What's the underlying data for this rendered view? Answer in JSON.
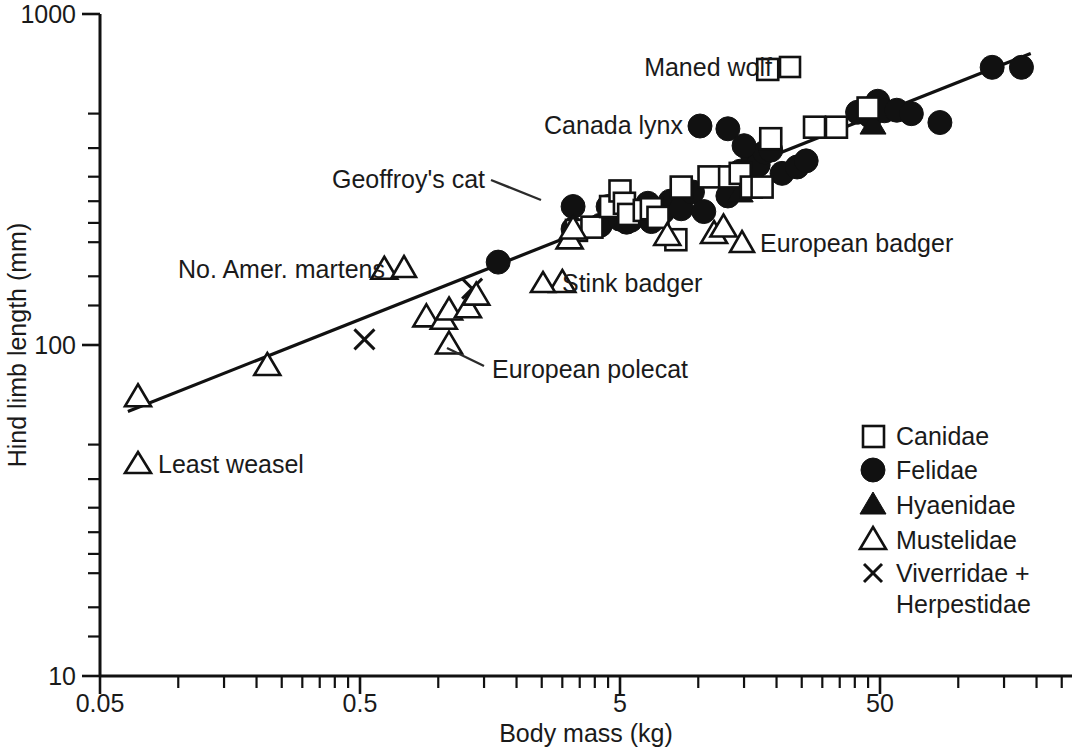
{
  "chart_data": {
    "type": "scatter",
    "title": "",
    "xlabel": "Body mass (kg)",
    "ylabel": "Hind limb length (mm)",
    "xscale": "log",
    "yscale": "log",
    "xlim": [
      0.05,
      200
    ],
    "ylim": [
      10,
      1000
    ],
    "xticklabels": [
      "0.05",
      "0.5",
      "5",
      "50"
    ],
    "xtickvalues": [
      0.05,
      0.5,
      5,
      50
    ],
    "yticklabels": [
      "1000",
      "100",
      "10"
    ],
    "ytickvalues": [
      1000,
      100,
      10
    ],
    "grid": false,
    "legend_position": "lower-right",
    "legend": [
      {
        "label": "Canidae",
        "marker": "open-square"
      },
      {
        "label": "Felidae",
        "marker": "filled-circle"
      },
      {
        "label": "Hyaenidae",
        "marker": "filled-triangle"
      },
      {
        "label": "Mustelidae",
        "marker": "open-triangle"
      },
      {
        "label": "Viverridae +",
        "marker": "cross-x"
      },
      {
        "label": "Herpestidae",
        "marker": "none"
      }
    ],
    "fit_line": {
      "description": "allometric regression line",
      "x_start": 0.064,
      "y_start": 63,
      "x_end": 190,
      "y_end": 760
    },
    "annotations": [
      {
        "text": "Maned wolf",
        "marker": "open-square"
      },
      {
        "text": "Canada lynx",
        "marker": "filled-circle"
      },
      {
        "text": "Geoffroy's cat",
        "marker": "leader-line"
      },
      {
        "text": "No. Amer. martens",
        "marker": "open-triangle"
      },
      {
        "text": "Stink badger",
        "marker": "open-triangle"
      },
      {
        "text": "European badger",
        "marker": "open-triangle"
      },
      {
        "text": "European polecat",
        "marker": "leader-line"
      },
      {
        "text": "Least weasel",
        "marker": "open-triangle"
      }
    ],
    "series": [
      {
        "name": "Canidae",
        "marker": "open-square",
        "points": [
          [
            3.4,
            222
          ],
          [
            3.9,
            227
          ],
          [
            4.6,
            262
          ],
          [
            5.0,
            292
          ],
          [
            5.2,
            268
          ],
          [
            5.4,
            248
          ],
          [
            6.2,
            255
          ],
          [
            6.6,
            258
          ],
          [
            7.0,
            243
          ],
          [
            8.2,
            208
          ],
          [
            8.6,
            300
          ],
          [
            11.0,
            322
          ],
          [
            13.2,
            322
          ],
          [
            14.5,
            330
          ],
          [
            16.0,
            300
          ],
          [
            17.6,
            300
          ],
          [
            19.0,
            420
          ],
          [
            28.0,
            455
          ],
          [
            34.0,
            455
          ],
          [
            45.0,
            520
          ],
          [
            18.5,
            680
          ]
        ]
      },
      {
        "name": "Felidae",
        "marker": "filled-circle",
        "points": [
          [
            1.7,
            178
          ],
          [
            3.3,
            262
          ],
          [
            3.3,
            224
          ],
          [
            4.2,
            230
          ],
          [
            4.5,
            262
          ],
          [
            5.0,
            240
          ],
          [
            5.3,
            235
          ],
          [
            5.5,
            238
          ],
          [
            5.8,
            246
          ],
          [
            6.4,
            268
          ],
          [
            6.6,
            236
          ],
          [
            7.3,
            252
          ],
          [
            7.8,
            272
          ],
          [
            8.6,
            258
          ],
          [
            9.5,
            290
          ],
          [
            10.5,
            253
          ],
          [
            13.0,
            282
          ],
          [
            14.5,
            335
          ],
          [
            15.5,
            300
          ],
          [
            16.2,
            372
          ],
          [
            17.0,
            350
          ],
          [
            18.0,
            382
          ],
          [
            19.0,
            388
          ],
          [
            21.0,
            330
          ],
          [
            24.0,
            345
          ],
          [
            13.0,
            450
          ],
          [
            15.0,
            400
          ],
          [
            26.0,
            360
          ],
          [
            41.0,
            505
          ],
          [
            46.0,
            490
          ],
          [
            49.0,
            545
          ],
          [
            52.0,
            510
          ],
          [
            58.0,
            512
          ],
          [
            66.0,
            500
          ],
          [
            85.0,
            470
          ],
          [
            135.0,
            690
          ],
          [
            175.0,
            690
          ]
        ]
      },
      {
        "name": "Hyaenidae",
        "marker": "filled-triangle",
        "points": [
          [
            14.5,
            290
          ],
          [
            47.0,
            465
          ]
        ]
      },
      {
        "name": "Mustelidae",
        "marker": "open-triangle",
        "points": [
          [
            0.07,
            70
          ],
          [
            0.22,
            87
          ],
          [
            0.9,
            122
          ],
          [
            1.05,
            120
          ],
          [
            1.1,
            128
          ],
          [
            1.1,
            101
          ],
          [
            1.3,
            130
          ],
          [
            1.4,
            142
          ],
          [
            0.62,
            170
          ],
          [
            3.2,
            210
          ],
          [
            3.3,
            225
          ],
          [
            7.6,
            215
          ],
          [
            11.5,
            218
          ],
          [
            3.0,
            155
          ],
          [
            12.5,
            228
          ]
        ]
      },
      {
        "name": "Viverridae + Herpestidae",
        "marker": "cross-x",
        "points": [
          [
            0.52,
            104
          ],
          [
            1.35,
            148
          ]
        ]
      }
    ]
  },
  "axes": {
    "x_title": "Body mass (kg)",
    "y_title": "Hind limb length (mm)",
    "x_ticks": [
      "0.05",
      "0.5",
      "5",
      "50"
    ],
    "y_ticks": [
      "1000",
      "100",
      "10"
    ]
  },
  "legend": {
    "items": [
      {
        "label": "Canidae"
      },
      {
        "label": "Felidae"
      },
      {
        "label": "Hyaenidae"
      },
      {
        "label": "Mustelidae"
      },
      {
        "label": "Viverridae +"
      },
      {
        "label": "Herpestidae"
      }
    ]
  },
  "annotations": {
    "maned_wolf": "Maned wolf",
    "canada_lynx": "Canada lynx",
    "geoffroys_cat": "Geoffroy's cat",
    "no_amer_martens": "No. Amer. martens",
    "stink_badger": "Stink badger",
    "european_badger": "European badger",
    "european_polecat": "European polecat",
    "least_weasel": "Least weasel"
  }
}
